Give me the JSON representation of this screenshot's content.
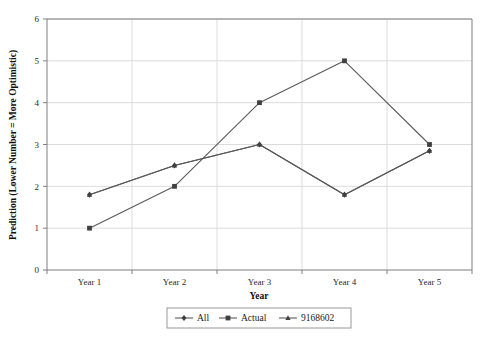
{
  "chart_data": {
    "type": "line",
    "title": "",
    "xlabel": "Year",
    "ylabel": "Prediction (Lower Number = More Optimistic)",
    "categories": [
      "Year 1",
      "Year 2",
      "Year 3",
      "Year 4",
      "Year 5"
    ],
    "ylim": [
      0,
      6
    ],
    "yticks": [
      "0",
      "1",
      "2",
      "3",
      "4",
      "5",
      "6"
    ],
    "grid": true,
    "legend_position": "bottom",
    "series": [
      {
        "name": "All",
        "marker": "diamond",
        "values": [
          1.8,
          2.5,
          3.0,
          1.8,
          2.85
        ]
      },
      {
        "name": "Actual",
        "marker": "square",
        "values": [
          1.0,
          2.0,
          4.0,
          5.0,
          3.0
        ]
      },
      {
        "name": "9168602",
        "marker": "triangle",
        "values": [
          1.8,
          2.5,
          3.0,
          1.8,
          2.85
        ]
      }
    ],
    "colors": {
      "line": "#595959",
      "marker": "#404040",
      "grid": "#dcdcdc",
      "axis": "#7f7f7f",
      "background": "#ffffff"
    }
  },
  "legend": {
    "items": [
      {
        "label": "All"
      },
      {
        "label": "Actual"
      },
      {
        "label": "9168602"
      }
    ]
  }
}
